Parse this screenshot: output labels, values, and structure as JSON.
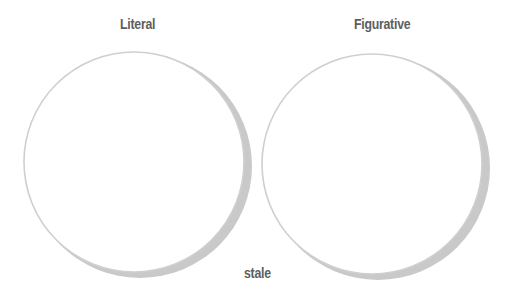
{
  "diagram": {
    "type": "venn-two-circles",
    "circles": [
      {
        "label": "Literal",
        "items": []
      },
      {
        "label": "Figurative",
        "items": []
      }
    ],
    "center_label": "stale",
    "colors": {
      "outline": "#c8c8c8",
      "shadow": "#c4c4c4",
      "text": "#5e5e5e"
    }
  }
}
